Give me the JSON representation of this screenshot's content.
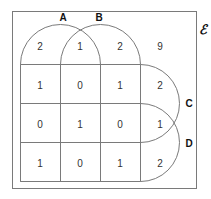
{
  "diagram": {
    "type": "four-set-venn-karnaugh-style",
    "universal_label": "ℰ",
    "sets": [
      {
        "name": "A",
        "label": "A"
      },
      {
        "name": "B",
        "label": "B"
      },
      {
        "name": "C",
        "label": "C"
      },
      {
        "name": "D",
        "label": "D"
      }
    ],
    "regions": [
      [
        "2",
        "1",
        "2",
        "9"
      ],
      [
        "1",
        "0",
        "1",
        "2"
      ],
      [
        "0",
        "1",
        "0",
        "1"
      ],
      [
        "1",
        "0",
        "1",
        "2"
      ]
    ],
    "colors": {
      "line": "#7a7a7a",
      "text": "#333333",
      "label": "#111111",
      "background": "#ffffff"
    }
  }
}
